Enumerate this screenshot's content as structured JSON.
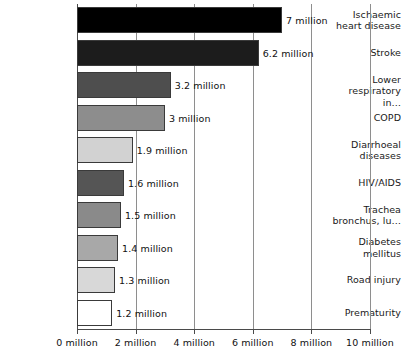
{
  "chart_data": {
    "type": "bar",
    "orientation": "horizontal",
    "title": "",
    "subtitle": "",
    "xlabel": "",
    "ylabel": "",
    "xlim": [
      0,
      10
    ],
    "xticks": [
      0,
      2,
      4,
      6,
      8,
      10
    ],
    "xtick_labels": [
      "0 million",
      "2 million",
      "4 million",
      "6 million",
      "8 million",
      "10 million"
    ],
    "grid": true,
    "grid_axis": "x",
    "legend": false,
    "unit": "million",
    "categories": [
      "Ischaemic heart disease",
      "Stroke",
      "Lower respiratory in…",
      "COPD",
      "Diarrhoeal diseases",
      "HIV/AIDS",
      "Trachea bronchus, lu…",
      "Diabetes mellitus",
      "Road injury",
      "Prematurity"
    ],
    "values": [
      7,
      6.2,
      3.2,
      3,
      1.9,
      1.6,
      1.5,
      1.4,
      1.3,
      1.2
    ],
    "data_labels": [
      "7 million",
      "6.2 million",
      "3.2 million",
      "3 million",
      "1.9 million",
      "1.6 million",
      "1.5 million",
      "1.4 million",
      "1.3 million",
      "1.2 million"
    ],
    "bar_colors": [
      "#000000",
      "#1c1c1c",
      "#4e4e4e",
      "#8d8d8d",
      "#d2d2d2",
      "#555555",
      "#8a8a8a",
      "#a8a8a8",
      "#d8d8d8",
      "#ffffff"
    ],
    "bars": [
      {
        "label_line1": "Ischaemic",
        "label_line2": "heart disease",
        "value": 7,
        "value_label": "7 million",
        "color": "#000000"
      },
      {
        "label_line1": "Stroke",
        "label_line2": "",
        "value": 6.2,
        "value_label": "6.2 million",
        "color": "#1c1c1c"
      },
      {
        "label_line1": "Lower",
        "label_line2": "respiratory in…",
        "value": 3.2,
        "value_label": "3.2 million",
        "color": "#4e4e4e"
      },
      {
        "label_line1": "COPD",
        "label_line2": "",
        "value": 3,
        "value_label": "3 million",
        "color": "#8d8d8d"
      },
      {
        "label_line1": "Diarrhoeal",
        "label_line2": "diseases",
        "value": 1.9,
        "value_label": "1.9 million",
        "color": "#d2d2d2"
      },
      {
        "label_line1": "HIV/AIDS",
        "label_line2": "",
        "value": 1.6,
        "value_label": "1.6 million",
        "color": "#555555"
      },
      {
        "label_line1": "Trachea",
        "label_line2": "bronchus, lu…",
        "value": 1.5,
        "value_label": "1.5 million",
        "color": "#8a8a8a"
      },
      {
        "label_line1": "Diabetes",
        "label_line2": "mellitus",
        "value": 1.4,
        "value_label": "1.4 million",
        "color": "#a8a8a8"
      },
      {
        "label_line1": "Road injury",
        "label_line2": "",
        "value": 1.3,
        "value_label": "1.3 million",
        "color": "#d8d8d8"
      },
      {
        "label_line1": "Prematurity",
        "label_line2": "",
        "value": 1.2,
        "value_label": "1.2 million",
        "color": "#ffffff"
      }
    ]
  },
  "colors": {
    "background": "#ffffff",
    "axis": "#4a4a4a",
    "grid": "#8e8e8e",
    "text": "#111111",
    "bar_outline": "#3a3a3a"
  }
}
